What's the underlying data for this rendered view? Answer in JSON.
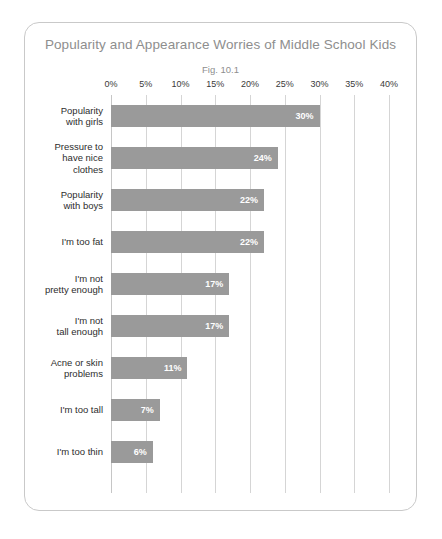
{
  "card": {
    "title": "Popularity and Appearance Worries of Middle School Kids",
    "subtitle": "Fig. 10.1"
  },
  "colors": {
    "bar_fill": "#9a9a9a",
    "bar_label": "#ffffff",
    "gridline": "#d5d5d5",
    "title": "#8e8e8e",
    "category_label": "#2d2d2d",
    "card_border": "#c9c9c9"
  },
  "chart_data": {
    "type": "bar",
    "orientation": "horizontal",
    "title": "Popularity and Appearance Worries of Middle School Kids",
    "subtitle": "Fig. 10.1",
    "xlabel": "",
    "ylabel": "",
    "xlim": [
      0,
      40
    ],
    "xticks": [
      0,
      5,
      10,
      15,
      20,
      25,
      30,
      35,
      40
    ],
    "xtick_labels": [
      "0%",
      "5%",
      "10%",
      "15%",
      "20%",
      "25%",
      "30%",
      "35%",
      "40%"
    ],
    "grid": true,
    "legend": false,
    "value_suffix": "%",
    "categories": [
      "Popularity\nwith girls",
      "Pressure to\nhave nice\nclothes",
      "Popularity\nwith boys",
      "I'm too fat",
      "I'm not\npretty enough",
      "I'm not\ntall enough",
      "Acne or skin\nproblems",
      "I'm too tall",
      "I'm too thin"
    ],
    "values": [
      30,
      24,
      22,
      22,
      17,
      17,
      11,
      7,
      6
    ],
    "value_labels": [
      "30%",
      "24%",
      "22%",
      "22%",
      "17%",
      "17%",
      "11%",
      "7%",
      "6%"
    ]
  }
}
